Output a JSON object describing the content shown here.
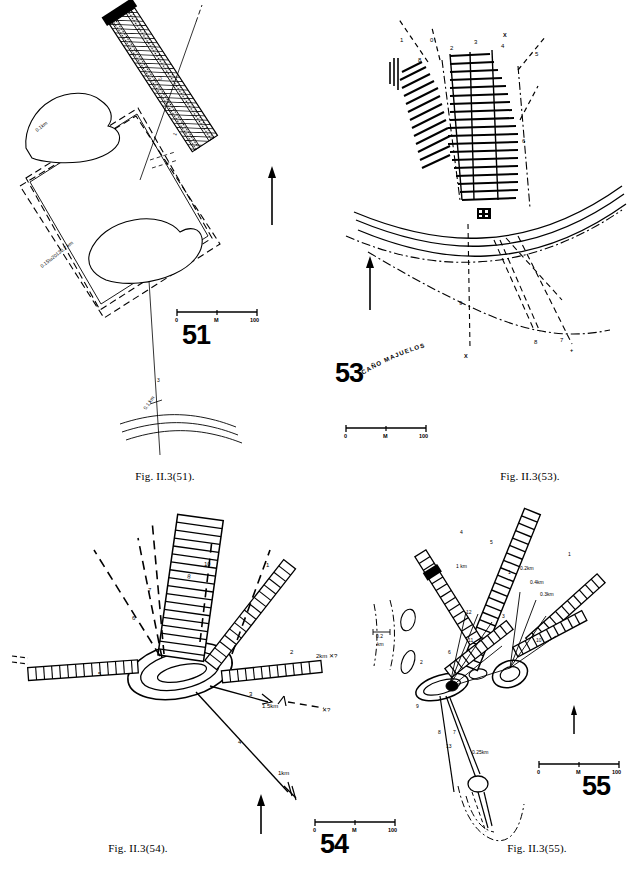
{
  "plate": {
    "title": "Fig. II.3 — site plans 51, 53, 54, 55",
    "ink": "#000000",
    "paper": "#ffffff"
  },
  "panels": [
    {
      "id": "51",
      "number_label": "51",
      "caption": "Fig. II.3(51).",
      "scale": {
        "left": "0",
        "mid": "M",
        "right": "100"
      },
      "north_arrow": "north-arrow",
      "annotations": [
        {
          "name": "dim-upper",
          "text": "0.1km"
        },
        {
          "name": "dim-lower",
          "text": "0.15–0.2 km"
        },
        {
          "name": "route-3",
          "text": "3"
        },
        {
          "name": "route-1",
          "text": "1"
        },
        {
          "name": "dim-river",
          "text": "0.1 km"
        },
        {
          "name": "interior",
          "text": "2"
        }
      ],
      "features": [
        "enclosure-outline",
        "hatched-causeway",
        "lagoon-north",
        "lagoon-south",
        "dashed-field-boundary",
        "river-channel"
      ]
    },
    {
      "id": "53",
      "number_label": "53",
      "caption": "Fig. II.3(53).",
      "scale": {
        "left": "0",
        "mid": "M",
        "right": "100"
      },
      "north_arrow": "north-arrow",
      "place_name": "CAÑO MAJUELOS",
      "annotations": [
        {
          "name": "route-1",
          "text": "1"
        },
        {
          "name": "route-0",
          "text": "0"
        },
        {
          "name": "route-8",
          "text": "8"
        },
        {
          "name": "route-2",
          "text": "2"
        },
        {
          "name": "route-3",
          "text": "3"
        },
        {
          "name": "route-x-top",
          "text": "X"
        },
        {
          "name": "route-4",
          "text": "4"
        },
        {
          "name": "route-5",
          "text": "5"
        },
        {
          "name": "route-6",
          "text": "6"
        },
        {
          "name": "route-9",
          "text": "9"
        },
        {
          "name": "route-x-bottom",
          "text": "X"
        },
        {
          "name": "route-8-lower",
          "text": "8"
        },
        {
          "name": "route-7",
          "text": "7"
        }
      ],
      "features": [
        "field-block-hatched",
        "field-block-diagonal",
        "stream-channel",
        "dash-dot-track",
        "settlement-cluster"
      ]
    },
    {
      "id": "54",
      "number_label": "54",
      "caption": "Fig. II.3(54).",
      "scale": {
        "left": "0",
        "mid": "M",
        "right": "100"
      },
      "north_arrow": "north-arrow",
      "annotations": [
        {
          "name": "spoke-1",
          "text": "1"
        },
        {
          "name": "spoke-2",
          "text": "2"
        },
        {
          "name": "spoke-2-dist",
          "text": "2km  ✖?"
        },
        {
          "name": "spoke-3",
          "text": "3"
        },
        {
          "name": "spoke-3-dist",
          "text": "1.5km"
        },
        {
          "name": "spoke-3-query",
          "text": "✖?"
        },
        {
          "name": "spoke-4",
          "text": "4"
        },
        {
          "name": "spoke-4-dist",
          "text": "1km"
        },
        {
          "name": "spoke-5",
          "text": "5"
        },
        {
          "name": "spoke-6",
          "text": "6"
        },
        {
          "name": "spoke-7",
          "text": "7"
        },
        {
          "name": "spoke-8",
          "text": "8"
        },
        {
          "name": "spoke-10",
          "text": "10"
        }
      ],
      "features": [
        "central-hub-oval",
        "radial-hatched-bands",
        "dashed-alignments",
        "plain-spokes"
      ]
    },
    {
      "id": "55",
      "number_label": "55",
      "caption": "Fig. II.3(55).",
      "scale": {
        "left": "0",
        "mid": "M",
        "right": "100"
      },
      "north_arrow": "north-arrow",
      "annotations": [
        {
          "name": "dist-left",
          "text": "0.2 km"
        },
        {
          "name": "dist-upper",
          "text": "1 km"
        },
        {
          "name": "dist-right-a",
          "text": "0.2km"
        },
        {
          "name": "dist-right-b",
          "text": "0.4km"
        },
        {
          "name": "dist-right-c",
          "text": "0.3km"
        },
        {
          "name": "dist-lower",
          "text": "0.25km"
        },
        {
          "name": "spoke-1",
          "text": "1"
        },
        {
          "name": "spoke-2",
          "text": "2"
        },
        {
          "name": "spoke-3",
          "text": "3"
        },
        {
          "name": "spoke-4",
          "text": "4"
        },
        {
          "name": "spoke-5",
          "text": "5"
        },
        {
          "name": "spoke-6",
          "text": "6"
        },
        {
          "name": "spoke-7",
          "text": "7"
        },
        {
          "name": "spoke-8",
          "text": "8"
        },
        {
          "name": "spoke-9",
          "text": "9"
        },
        {
          "name": "spoke-10",
          "text": "10"
        },
        {
          "name": "spoke-11",
          "text": "11"
        },
        {
          "name": "spoke-12",
          "text": "12"
        },
        {
          "name": "spoke-13",
          "text": "13"
        }
      ],
      "features": [
        "hub-west-oval",
        "hub-east-oval",
        "radial-hatched-bands",
        "dash-dot-contours",
        "small-mounds",
        "lower-node"
      ]
    }
  ]
}
